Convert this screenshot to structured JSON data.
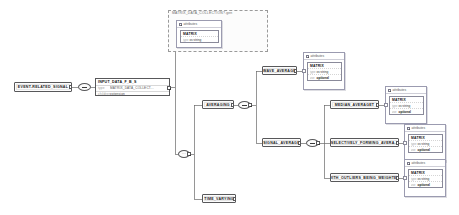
{
  "diagram": {
    "type": "schema-tree",
    "colors": {
      "node_border": "#58585a",
      "node_fill": "#fdfdfd",
      "line": "#6a6a6a",
      "group_border": "#9a9a9a",
      "attr_border": "#9b9bb0"
    }
  },
  "group": {
    "label": "MATRIX_DATA_COLLECTION?.gen"
  },
  "nodes": {
    "event_related_signal": {
      "label": "EVENT-RELATED_SIGNAL"
    },
    "input_data": {
      "title": "INPUT_DATA_F_B_S",
      "rows": [
        {
          "key": "type",
          "value": "MATRIX_DATA_COLLECT..."
        },
        {
          "key": "children",
          "value": "extension"
        }
      ]
    },
    "averaging": {
      "label": "AVERAGING"
    },
    "time_varying": {
      "label": "TIME_VARYING"
    },
    "wave_average": {
      "label": "WAVE_AVERAGE"
    },
    "signal_average": {
      "label": "SIGNAL_AVERAGE"
    },
    "median_average": {
      "label": "MEDIAN_AVERAGET"
    },
    "selectively_forming": {
      "label": "SELECTIVELY_FORMING_AVERA..."
    },
    "with_outliers": {
      "label": "WITH_OUTLIERS_BEING_WEIGHTE..."
    }
  },
  "connectors": {
    "sequence_label": "sequence",
    "choice_label": "choice"
  },
  "attribute_cards": {
    "header": "attributes",
    "name": "MATRIX",
    "rows": [
      {
        "key": "type",
        "value": "xs:string"
      },
      {
        "key": "use",
        "value": "optional"
      }
    ],
    "group_rows": [
      {
        "key": "type",
        "value": "xs:string"
      }
    ]
  }
}
